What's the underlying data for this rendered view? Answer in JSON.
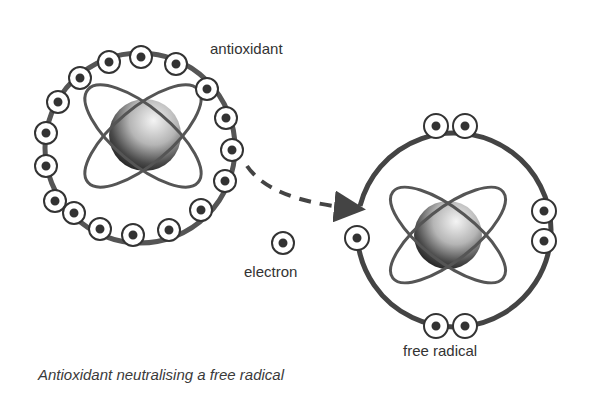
{
  "labels": {
    "antioxidant": "antioxidant",
    "electron": "electron",
    "free_radical": "free radical"
  },
  "caption": "Antioxidant neutralising a free radical",
  "colors": {
    "line": "#444444",
    "text": "#333333",
    "background": "#ffffff"
  },
  "antioxidant": {
    "ring": {
      "cx": 140,
      "cy": 148,
      "r": 95
    },
    "nucleus": {
      "cx": 145,
      "cy": 135
    },
    "electron_count": 17
  },
  "free_radical": {
    "ring": {
      "cx": 455,
      "cy": 228,
      "r": 97
    },
    "nucleus": {
      "cx": 448,
      "cy": 235
    },
    "electron_pairs": [
      "top",
      "right",
      "bottom"
    ],
    "unpaired_electron": "left"
  },
  "transfer": {
    "from": "antioxidant",
    "to": "free radical",
    "arrow_style": "dashed"
  }
}
